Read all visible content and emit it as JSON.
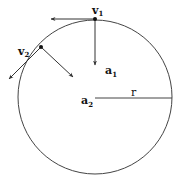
{
  "diagram": {
    "type": "uniform-circular-motion",
    "circle": {
      "cx": 95,
      "cy": 97,
      "r": 77,
      "stroke": "#444444"
    },
    "radius_label": "r",
    "points": [
      {
        "id": "p1",
        "x": 95,
        "y": 19,
        "velocity_label": "v",
        "velocity_sub": "1",
        "accel_label": "a",
        "accel_sub": "1"
      },
      {
        "id": "p2",
        "x": 41,
        "y": 47,
        "velocity_label": "v",
        "velocity_sub": "2",
        "accel_label": "a",
        "accel_sub": "2"
      }
    ]
  }
}
